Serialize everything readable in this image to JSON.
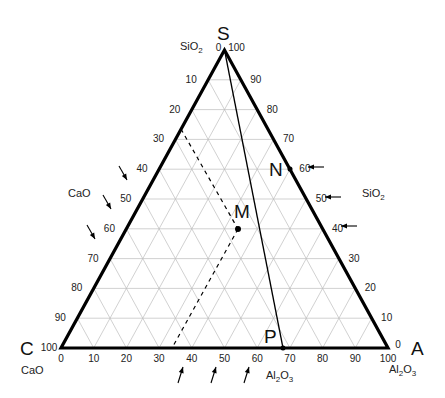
{
  "diagram": {
    "vertices": {
      "S": {
        "label": "S",
        "oxide": "SiO2",
        "px": [
          224.5,
          50
        ]
      },
      "C": {
        "label": "C",
        "oxide": "CaO",
        "px": [
          61,
          348
        ]
      },
      "A": {
        "label": "A",
        "oxide": "Al2O3",
        "px": [
          388,
          348
        ]
      }
    },
    "axis_labels": {
      "top_sio2": "SiO",
      "left_cao": "CaO",
      "right_sio2": "SiO",
      "bottom_cao": "CaO",
      "bottom_al2o3": "Al",
      "corner_al2o3": "Al"
    },
    "left_ticks": [
      "0",
      "10",
      "20",
      "30",
      "40",
      "50",
      "60",
      "70",
      "80",
      "90",
      "100"
    ],
    "right_ticks": [
      "100",
      "90",
      "80",
      "70",
      "60",
      "50",
      "40",
      "30",
      "20",
      "10",
      "0"
    ],
    "bottom_ticks": [
      "0",
      "10",
      "20",
      "30",
      "40",
      "50",
      "60",
      "70",
      "80",
      "90",
      "100"
    ],
    "points": [
      {
        "label": "N",
        "sio2": 60,
        "note": "on S–A edge"
      },
      {
        "label": "M",
        "note": "interior point"
      },
      {
        "label": "P",
        "al2o3": 68,
        "note": "on C–A edge"
      }
    ],
    "lines": [
      {
        "name": "S-P",
        "style": "solid",
        "from": "S",
        "to": "P"
      },
      {
        "name": "dashed-guide",
        "style": "dashed",
        "from_left_scale": 30,
        "to_bottom_scale": 34
      }
    ],
    "arrows": {
      "left_cao": 3,
      "right_sio2": 3,
      "bottom_al2o3": 3
    },
    "colors": {
      "edge": "#000000",
      "grid": "#bdbdbd",
      "text": "#222222"
    }
  }
}
